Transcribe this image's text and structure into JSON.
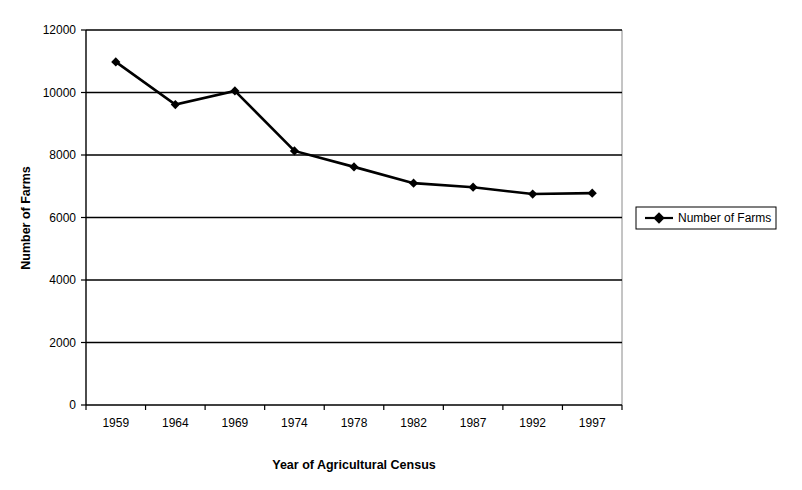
{
  "chart_data": {
    "type": "line",
    "title": "",
    "xlabel": "Year of Agricultural Census",
    "ylabel": "Number of Farms",
    "categories": [
      "1959",
      "1964",
      "1969",
      "1974",
      "1978",
      "1982",
      "1987",
      "1992",
      "1997"
    ],
    "series": [
      {
        "name": "Number of Farms",
        "values": [
          10980,
          9615,
          10050,
          8130,
          7620,
          7100,
          6970,
          6750,
          6780
        ]
      }
    ],
    "ylim": [
      0,
      12000
    ],
    "ytick_labels": [
      "0",
      "2000",
      "4000",
      "6000",
      "8000",
      "10000",
      "12000"
    ],
    "ytick_values": [
      0,
      2000,
      4000,
      6000,
      8000,
      10000,
      12000
    ],
    "grid": true,
    "grid_axis": "y",
    "legend": [
      "Number of Farms"
    ],
    "legend_position": "right",
    "marker": "diamond",
    "line_color": "#000000",
    "background_color": "#ffffff"
  },
  "legend": {
    "entries": [
      {
        "label": "Number of Farms",
        "marker": "diamond-marker",
        "color": "#000000"
      }
    ]
  },
  "axes": {
    "y_title": "Number of Farms",
    "x_title": "Year of Agricultural Census"
  }
}
